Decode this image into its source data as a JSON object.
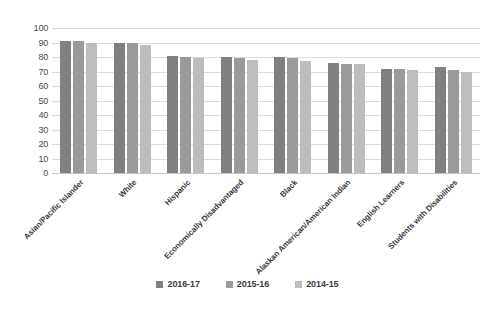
{
  "chart_data": {
    "type": "bar",
    "title": "",
    "xlabel": "",
    "ylabel": "",
    "ylim": [
      0,
      100
    ],
    "grid": true,
    "legend_position": "bottom",
    "categories": [
      "Asian/Pacific Islander",
      "White",
      "Hispanic",
      "Economically Disadvantaged",
      "Black",
      "Alaskan American/American Indian",
      "English Learners",
      "Students with Disabilities"
    ],
    "ytick_labels": [
      "0",
      "10",
      "20",
      "30",
      "40",
      "50",
      "60",
      "70",
      "80",
      "90",
      "100"
    ],
    "ytick_values": [
      0,
      10,
      20,
      30,
      40,
      50,
      60,
      70,
      80,
      90,
      100
    ],
    "series": [
      {
        "name": "2016-17",
        "color": "#808080",
        "values": [
          91,
          90,
          81,
          80,
          80,
          76,
          72,
          73
        ]
      },
      {
        "name": "2015-16",
        "color": "#9a9a9a",
        "values": [
          91,
          90,
          80,
          79,
          79,
          75,
          72,
          71
        ]
      },
      {
        "name": "2014-15",
        "color": "#bdbdbd",
        "values": [
          90,
          88,
          79,
          78,
          77,
          75,
          71,
          70
        ]
      }
    ]
  },
  "colors": {
    "series_2016_17": "#808080",
    "series_2015_16": "#9a9a9a",
    "series_2014_15": "#bdbdbd",
    "gridline": "#dcdcdc",
    "axis_text": "#4a4a4a",
    "background": "#ffffff"
  }
}
